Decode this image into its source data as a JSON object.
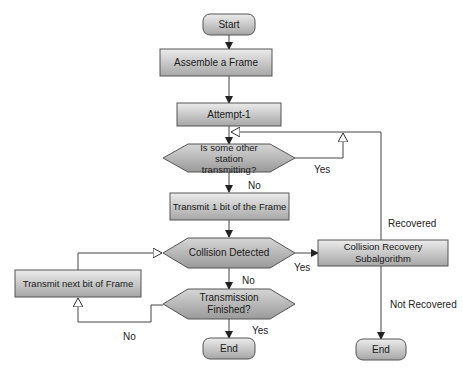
{
  "nodes": {
    "start": "Start",
    "assemble": "Assemble a Frame",
    "attempt": "Attempt-1",
    "check_line_1": "Is some other",
    "check_line_2": "station transmitting?",
    "transmit_one": "Transmit 1 bit of the Frame",
    "collision": "Collision Detected",
    "recovery": "Collision Recovery Subalgorithm",
    "transmit_next": "Transmit next bit of Frame",
    "finished": "Transmission Finished?",
    "end_main": "End",
    "end_recovery": "End"
  },
  "edge_labels": {
    "busy_yes": "Yes",
    "busy_no": "No",
    "collision_yes": "Yes",
    "collision_no": "No",
    "finished_yes": "Yes",
    "finished_no": "No",
    "recovered": "Recovered",
    "not_recovered": "Not Recovered"
  },
  "colors": {
    "fill_top": "#e8e8e8",
    "fill_bottom": "#a9a9a9",
    "stroke": "#555555",
    "line": "#444444"
  }
}
